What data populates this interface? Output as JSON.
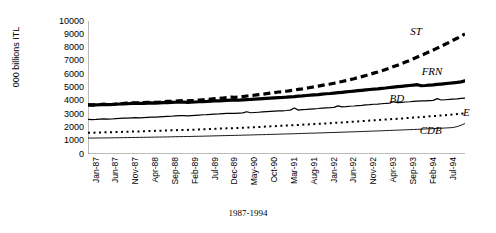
{
  "chart_data": {
    "type": "line",
    "title": "",
    "subtitle": "",
    "xlabel": "1987-1994",
    "ylabel": "000 billions ITL",
    "ylim": [
      0,
      10000
    ],
    "ytick_labels": [
      "10000",
      "9000",
      "8000",
      "7000",
      "6000",
      "5000",
      "4000",
      "3000",
      "2000",
      "1000",
      "0"
    ],
    "ytick_values": [
      10000,
      9000,
      8000,
      7000,
      6000,
      5000,
      4000,
      3000,
      2000,
      1000,
      0
    ],
    "xtick_labels": [
      "Jan-87",
      "Jun-87",
      "Nov-87",
      "Apr-88",
      "Sep-88",
      "Feb-89",
      "Jul-89",
      "Dec-89",
      "May-90",
      "Oct-90",
      "Mar-91",
      "Aug-91",
      "Jan-92",
      "Jun-92",
      "Nov-92",
      "Apr-93",
      "Sep-93",
      "Feb-94",
      "Jul-94"
    ],
    "xtick_interval_months": 5,
    "x_start": "Jan-87",
    "x_end": "Dec-94",
    "n_points": 96,
    "grid": false,
    "legend_position": "inline-annotations",
    "annotations": [
      {
        "text": "ST",
        "x_frac": 0.855,
        "y_value": 9200
      },
      {
        "text": "FRN",
        "x_frac": 0.885,
        "y_value": 6150
      },
      {
        "text": "BD",
        "x_frac": 0.8,
        "y_value": 4150
      },
      {
        "text": "E",
        "x_frac": 0.995,
        "y_value": 3050
      },
      {
        "text": "CDB",
        "x_frac": 0.88,
        "y_value": 1750
      }
    ],
    "series": [
      {
        "name": "ST",
        "style": "thick-dashed",
        "color": "#000000",
        "width": 3.2,
        "dash": "7,4",
        "values": [
          3700,
          3680,
          3700,
          3720,
          3740,
          3700,
          3720,
          3760,
          3790,
          3800,
          3820,
          3840,
          3850,
          3840,
          3860,
          3880,
          3900,
          3880,
          3900,
          3930,
          3950,
          3960,
          3980,
          4000,
          4010,
          3990,
          4010,
          4030,
          4060,
          4080,
          4100,
          4130,
          4160,
          4180,
          4210,
          4240,
          4270,
          4260,
          4290,
          4320,
          4360,
          4390,
          4420,
          4460,
          4500,
          4540,
          4580,
          4620,
          4660,
          4680,
          4720,
          4770,
          4810,
          4860,
          4900,
          4950,
          5000,
          5050,
          5100,
          5160,
          5220,
          5260,
          5320,
          5390,
          5450,
          5520,
          5590,
          5660,
          5740,
          5820,
          5900,
          5990,
          6080,
          6160,
          6260,
          6360,
          6460,
          6570,
          6680,
          6790,
          6910,
          7030,
          7160,
          7290,
          7420,
          7550,
          7690,
          7820,
          7960,
          8100,
          8250,
          8400,
          8550,
          8700,
          8860,
          9020
        ]
      },
      {
        "name": "FRN",
        "style": "thick-solid",
        "color": "#000000",
        "width": 3.2,
        "dash": "",
        "values": [
          3700,
          3690,
          3700,
          3710,
          3730,
          3710,
          3720,
          3740,
          3760,
          3770,
          3780,
          3800,
          3810,
          3800,
          3810,
          3830,
          3840,
          3830,
          3840,
          3860,
          3870,
          3880,
          3890,
          3900,
          3910,
          3880,
          3900,
          3910,
          3930,
          3940,
          3950,
          3970,
          3990,
          4000,
          4010,
          4030,
          4050,
          4040,
          4050,
          4070,
          4090,
          4100,
          4120,
          4140,
          4160,
          4180,
          4200,
          4220,
          4240,
          4250,
          4270,
          4300,
          4320,
          4350,
          4370,
          4400,
          4420,
          4450,
          4470,
          4500,
          4530,
          4550,
          4580,
          4610,
          4640,
          4670,
          4700,
          4730,
          4760,
          4790,
          4820,
          4850,
          4880,
          4900,
          4930,
          4960,
          5000,
          5030,
          5060,
          5090,
          5120,
          5150,
          5180,
          5210,
          5130,
          5150,
          5180,
          5200,
          5230,
          5260,
          5290,
          5320,
          5350,
          5380,
          5420,
          5500
        ]
      },
      {
        "name": "BD",
        "style": "thin-solid-spiky",
        "color": "#000000",
        "width": 1.2,
        "dash": "",
        "values": [
          2600,
          2590,
          2600,
          2620,
          2640,
          2620,
          2630,
          2660,
          2680,
          2690,
          2700,
          2720,
          2730,
          2720,
          2740,
          2760,
          2780,
          2770,
          2790,
          2810,
          2830,
          2840,
          2860,
          2880,
          2890,
          2870,
          2890,
          2910,
          2930,
          2950,
          2960,
          2980,
          3000,
          3010,
          3030,
          3050,
          3060,
          3050,
          3070,
          3090,
          3180,
          3100,
          3120,
          3140,
          3160,
          3180,
          3200,
          3220,
          3240,
          3250,
          3270,
          3300,
          3460,
          3300,
          3330,
          3350,
          3380,
          3400,
          3420,
          3450,
          3470,
          3480,
          3510,
          3620,
          3540,
          3560,
          3590,
          3610,
          3640,
          3660,
          3690,
          3710,
          3740,
          3750,
          3780,
          3800,
          3830,
          3930,
          3860,
          3880,
          3910,
          3930,
          3960,
          3980,
          4000,
          3990,
          4010,
          4030,
          4160,
          4060,
          4080,
          4100,
          4130,
          4150,
          4180,
          4200
        ]
      },
      {
        "name": "E",
        "style": "dotted",
        "color": "#000000",
        "width": 2.0,
        "dash": "2,3.5",
        "values": [
          1600,
          1600,
          1610,
          1620,
          1630,
          1630,
          1640,
          1650,
          1660,
          1670,
          1680,
          1690,
          1700,
          1700,
          1710,
          1720,
          1730,
          1740,
          1750,
          1760,
          1770,
          1780,
          1790,
          1800,
          1810,
          1810,
          1820,
          1830,
          1850,
          1860,
          1870,
          1880,
          1890,
          1910,
          1920,
          1930,
          1940,
          1950,
          1960,
          1980,
          1990,
          2000,
          2020,
          2030,
          2050,
          2060,
          2080,
          2090,
          2110,
          2120,
          2140,
          2150,
          2170,
          2180,
          2200,
          2220,
          2230,
          2250,
          2270,
          2280,
          2300,
          2320,
          2340,
          2350,
          2370,
          2390,
          2410,
          2430,
          2450,
          2470,
          2490,
          2510,
          2530,
          2550,
          2570,
          2590,
          2610,
          2630,
          2650,
          2670,
          2690,
          2720,
          2740,
          2760,
          2780,
          2800,
          2830,
          2850,
          2870,
          2900,
          2920,
          2950,
          2970,
          3000,
          3020,
          3050
        ]
      },
      {
        "name": "CDB",
        "style": "thin-solid",
        "color": "#000000",
        "width": 0.9,
        "dash": "",
        "values": [
          1200,
          1200,
          1200,
          1205,
          1210,
          1210,
          1215,
          1220,
          1225,
          1230,
          1235,
          1240,
          1245,
          1250,
          1255,
          1260,
          1265,
          1270,
          1275,
          1280,
          1285,
          1290,
          1300,
          1305,
          1310,
          1315,
          1320,
          1330,
          1335,
          1340,
          1350,
          1355,
          1365,
          1370,
          1380,
          1385,
          1395,
          1400,
          1410,
          1415,
          1425,
          1430,
          1440,
          1450,
          1455,
          1465,
          1475,
          1480,
          1490,
          1500,
          1510,
          1515,
          1525,
          1535,
          1545,
          1555,
          1565,
          1570,
          1580,
          1590,
          1600,
          1610,
          1620,
          1630,
          1640,
          1650,
          1660,
          1670,
          1680,
          1690,
          1700,
          1715,
          1725,
          1735,
          1745,
          1760,
          1770,
          1780,
          1795,
          1805,
          1820,
          1830,
          1845,
          1855,
          1870,
          1885,
          1895,
          1910,
          1925,
          1940,
          1955,
          1970,
          1990,
          2060,
          2160,
          2290
        ]
      }
    ]
  }
}
